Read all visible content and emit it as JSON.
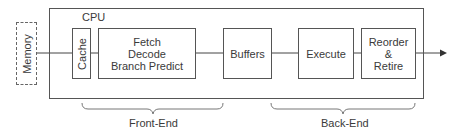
{
  "diagram": {
    "memory": {
      "label": "Memory"
    },
    "cpu": {
      "label": "CPU"
    },
    "blocks": [
      {
        "id": "cache",
        "label": "Cache"
      },
      {
        "id": "fetch",
        "lines": [
          "Fetch",
          "Decode",
          "Branch Predict"
        ]
      },
      {
        "id": "buffers",
        "label": "Buffers"
      },
      {
        "id": "execute",
        "label": "Execute"
      },
      {
        "id": "reorder",
        "lines": [
          "Reorder",
          "&",
          "Retire"
        ]
      }
    ],
    "groups": [
      {
        "id": "front-end",
        "label": "Front-End"
      },
      {
        "id": "back-end",
        "label": "Back-End"
      }
    ],
    "colors": {
      "stroke": "#555555",
      "text": "#3a3a3a",
      "background": "#ffffff"
    }
  }
}
